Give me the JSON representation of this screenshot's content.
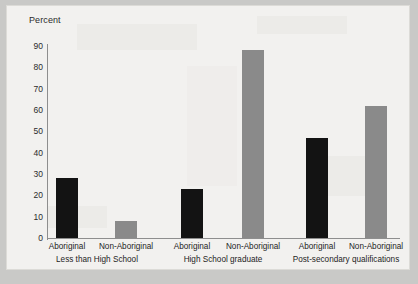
{
  "chart_data": {
    "type": "bar",
    "title": "",
    "xlabel": "",
    "ylabel": "Percent",
    "ylim": [
      0,
      90
    ],
    "yticks": [
      0,
      10,
      20,
      30,
      40,
      50,
      60,
      70,
      80,
      90
    ],
    "grid": false,
    "legend": "none",
    "categories": [
      "Less than High School",
      "High School graduate",
      "Post-secondary qualifications"
    ],
    "series": [
      {
        "name": "Aboriginal",
        "color": "#131313",
        "values": [
          28,
          23,
          47
        ]
      },
      {
        "name": "Non-Aboriginal",
        "color": "#8a8a8a",
        "values": [
          8,
          88,
          62
        ]
      }
    ],
    "bars": [
      {
        "group": "Less than High School",
        "label": "Aboriginal",
        "value": 28,
        "style": "dark"
      },
      {
        "group": "Less than High School",
        "label": "Non-Aboriginal",
        "value": 8,
        "style": "light"
      },
      {
        "group": "High School graduate",
        "label": "Aboriginal",
        "value": 23,
        "style": "dark"
      },
      {
        "group": "High School graduate",
        "label": "Non-Aboriginal",
        "value": 88,
        "style": "light"
      },
      {
        "group": "Post-secondary qualifications",
        "label": "Aboriginal",
        "value": 47,
        "style": "dark"
      },
      {
        "group": "Post-secondary qualifications",
        "label": "Non-Aboriginal",
        "value": 62,
        "style": "light"
      }
    ]
  },
  "axis": {
    "y_title": "Percent",
    "ticks": {
      "t0": "0",
      "t10": "10",
      "t20": "20",
      "t30": "30",
      "t40": "40",
      "t50": "50",
      "t60": "60",
      "t70": "70",
      "t80": "80",
      "t90": "90"
    }
  },
  "xaxis": {
    "bar_labels": {
      "l0": "Aboriginal",
      "l1": "Non-Aboriginal",
      "l2": "Aboriginal",
      "l3": "Non-Aboriginal",
      "l4": "Aboriginal",
      "l5": "Non-Aboriginal"
    },
    "group_labels": {
      "g0": "Less than High School",
      "g1": "High School graduate",
      "g2": "Post-secondary qualifications"
    }
  },
  "colors": {
    "aboriginal_bar": "#131313",
    "non_aboriginal_bar": "#8a8a8a",
    "axis_line": "#8e8e8e",
    "paper": "#f2f1ef",
    "page_background": "#c9c9c7"
  }
}
